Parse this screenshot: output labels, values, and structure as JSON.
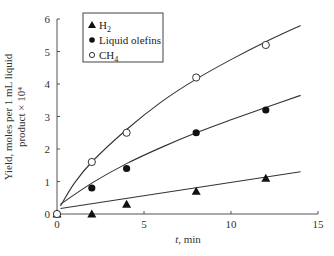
{
  "chart_data": {
    "type": "scatter",
    "title": "",
    "xlabel": "t, min",
    "ylabel_line1": "Yield, moles per 1 mL liquid",
    "ylabel_line2": "product × 10⁴",
    "xlim": [
      0,
      15
    ],
    "ylim": [
      0,
      6
    ],
    "xticks": [
      0,
      5,
      10,
      15
    ],
    "yticks": [
      0,
      1,
      2,
      3,
      4,
      5,
      6
    ],
    "grid": false,
    "legend_position": "upper-left",
    "series": [
      {
        "name": "H2",
        "label_main": "H",
        "label_sub": "2",
        "marker": "filled-triangle",
        "x": [
          0,
          2,
          4,
          8,
          12
        ],
        "y": [
          0,
          0,
          0.3,
          0.7,
          1.1
        ],
        "fit": {
          "type": "linear",
          "x": [
            0.2,
            14
          ],
          "y": [
            0.17,
            1.3
          ]
        }
      },
      {
        "name": "Liquid olefins",
        "label_main": "Liquid olefins",
        "label_sub": "",
        "marker": "filled-circle",
        "x": [
          0,
          2,
          4,
          8,
          12
        ],
        "y": [
          0,
          0.8,
          1.4,
          2.5,
          3.2
        ],
        "fit": {
          "type": "curve",
          "x": [
            0.2,
            2,
            4,
            6,
            8,
            10,
            12,
            14
          ],
          "y": [
            0.3,
            0.95,
            1.55,
            2.05,
            2.5,
            2.9,
            3.28,
            3.65
          ]
        }
      },
      {
        "name": "CH4",
        "label_main": "CH",
        "label_sub": "4",
        "marker": "open-circle",
        "x": [
          0,
          2,
          4,
          8,
          12
        ],
        "y": [
          0,
          1.6,
          2.5,
          4.2,
          5.2
        ],
        "fit": {
          "type": "curve",
          "x": [
            0.2,
            1,
            2,
            4,
            6,
            8,
            10,
            12,
            14
          ],
          "y": [
            0.25,
            0.95,
            1.6,
            2.6,
            3.45,
            4.15,
            4.75,
            5.3,
            5.8
          ]
        }
      }
    ]
  }
}
